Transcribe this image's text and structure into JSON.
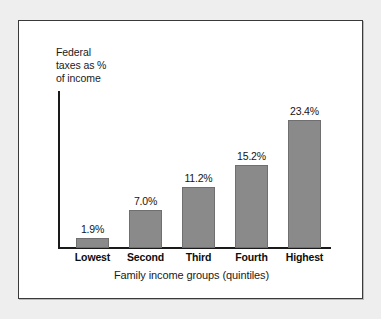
{
  "chart_data": {
    "type": "bar",
    "title": "",
    "categories": [
      "Lowest",
      "Second",
      "Third",
      "Fourth",
      "Highest"
    ],
    "values": [
      1.9,
      7.0,
      11.2,
      15.2,
      23.4
    ],
    "value_labels": [
      "1.9%",
      "7.0%",
      "11.2%",
      "15.2%",
      "23.4%"
    ],
    "xlabel": "Family income groups (quintiles)",
    "ylabel": "Federal\ntaxes as %\nof income",
    "ylim": [
      0,
      26
    ],
    "grid": false,
    "legend": false,
    "bar_color": "#8a8a8a",
    "axis_color": "#1a1a1a"
  },
  "figure": {
    "frame_border_color": "#3a3a3a",
    "background_color": "#ffffff",
    "page_background_color": "#eeeeee"
  }
}
